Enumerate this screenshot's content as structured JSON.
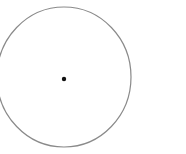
{
  "diagram": {
    "type": "circle-with-center-point",
    "circle": {
      "cx": 64,
      "cy": 77,
      "r": 68,
      "stroke": "#8a8a8a",
      "stroke_width": 1.2,
      "fill": "none"
    },
    "center_point": {
      "cx": 64,
      "cy": 79,
      "r": 2.2,
      "fill": "#111111"
    }
  }
}
